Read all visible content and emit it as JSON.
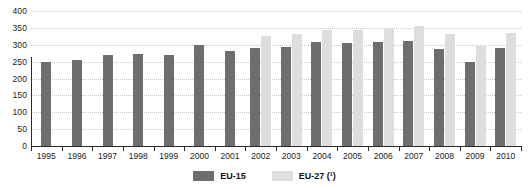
{
  "chart_data": {
    "type": "bar",
    "title": "",
    "xlabel": "",
    "ylabel": "",
    "categories": [
      "1995",
      "1996",
      "1997",
      "1998",
      "1999",
      "2000",
      "2001",
      "2002",
      "2003",
      "2004",
      "2005",
      "2006",
      "2007",
      "2008",
      "2009",
      "2010"
    ],
    "series": [
      {
        "name": "EU-15",
        "color": "#6e6e6e",
        "values": [
          248,
          255,
          271,
          272,
          271,
          298,
          283,
          291,
          294,
          307,
          306,
          308,
          312,
          287,
          250,
          289
        ]
      },
      {
        "name": "EU-27 (¹)",
        "color": "#dedede",
        "values": [
          null,
          null,
          null,
          null,
          null,
          null,
          null,
          326,
          333,
          345,
          343,
          348,
          356,
          332,
          297,
          335
        ]
      }
    ],
    "ylim": [
      0,
      400
    ],
    "yticks": [
      0,
      50,
      100,
      150,
      200,
      250,
      300,
      350,
      400
    ],
    "ytick_labels": [
      "0",
      "50",
      "100",
      "150",
      "200",
      "250",
      "300",
      "350",
      "400"
    ],
    "grid": true,
    "legend_position": "bottom"
  },
  "legend": {
    "items": [
      {
        "label": "EU-15",
        "color": "#6e6e6e"
      },
      {
        "label": "EU-27 (¹)",
        "color": "#dedede"
      }
    ]
  }
}
